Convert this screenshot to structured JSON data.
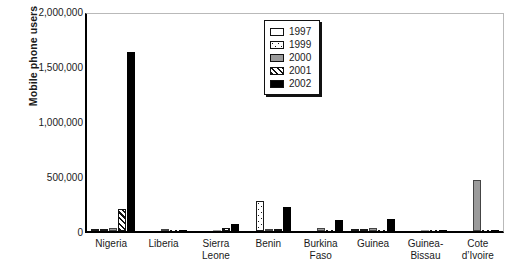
{
  "chart_data": {
    "type": "bar",
    "title": "",
    "xlabel": "",
    "ylabel": "Mobile phone users",
    "ylim": [
      0,
      2000000
    ],
    "ytick_labels": [
      "0",
      "500,000",
      "1,000,000",
      "1,500,000",
      "2,000,000"
    ],
    "ytick_values": [
      0,
      500000,
      1000000,
      1500000,
      2000000
    ],
    "grid": false,
    "legend_position": "top-center-right",
    "categories": [
      "Nigeria",
      "Liberia",
      "Sierra\nLeone",
      "Benin",
      "Burkina\nFaso",
      "Guinea",
      "Guinea-\nBissau",
      "Cote\nd’Ivoire"
    ],
    "series": [
      {
        "name": "1997",
        "style": "white",
        "values": [
          12000,
          0,
          0,
          0,
          0,
          5000,
          0,
          0
        ]
      },
      {
        "name": "1999",
        "style": "dotted",
        "values": [
          22000,
          0,
          0,
          275000,
          0,
          22000,
          0,
          0
        ]
      },
      {
        "name": "2000",
        "style": "gray",
        "values": [
          30000,
          3000,
          0,
          15000,
          25000,
          30000,
          0,
          460000
        ]
      },
      {
        "name": "2001",
        "style": "hatch",
        "values": [
          200000,
          0,
          30000,
          18000,
          0,
          0,
          0,
          0
        ]
      },
      {
        "name": "2002",
        "style": "black",
        "values": [
          1630000,
          0,
          67000,
          220000,
          100000,
          105000,
          0,
          0
        ]
      }
    ]
  },
  "legend": {
    "items": [
      {
        "label": "1997",
        "style": "white"
      },
      {
        "label": "1999",
        "style": "dotted"
      },
      {
        "label": "2000",
        "style": "gray"
      },
      {
        "label": "2001",
        "style": "hatch"
      },
      {
        "label": "2002",
        "style": "black"
      }
    ]
  },
  "colors": {
    "axis": "#000000",
    "frame": "#b9b9b9",
    "series_2000_gray": "#9b9b9b",
    "series_2002_black": "#000000",
    "background": "#ffffff"
  }
}
